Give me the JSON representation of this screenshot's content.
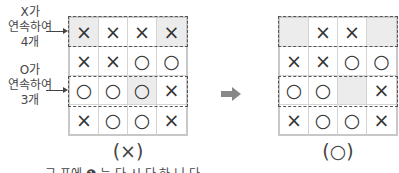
{
  "left_panel": {
    "labels": [
      {
        "lines": [
          "X가",
          "연속하여",
          "4개"
        ]
      },
      {
        "lines": [
          "O가",
          "연속하여",
          "3개"
        ]
      }
    ],
    "grid": [
      [
        "×",
        "×",
        "×",
        "×"
      ],
      [
        "×",
        "×",
        "○",
        "○"
      ],
      [
        "○",
        "○",
        "○",
        "×"
      ],
      [
        "×",
        "○",
        "○",
        "×"
      ]
    ],
    "shaded": [
      [
        0,
        0
      ],
      [
        0,
        3
      ],
      [
        2,
        2
      ]
    ],
    "caption": "(×)"
  },
  "right_panel": {
    "grid": [
      [
        "",
        "×",
        "×",
        ""
      ],
      [
        "×",
        "×",
        "○",
        "○"
      ],
      [
        "○",
        "○",
        "",
        "×"
      ],
      [
        "×",
        "○",
        "○",
        "×"
      ]
    ],
    "shaded": [
      [
        0,
        0
      ],
      [
        0,
        3
      ],
      [
        2,
        2
      ]
    ],
    "caption": "(○)"
  },
  "transition_arrow": "right-arrow-icon",
  "colors": {
    "shade": "#ececec",
    "arrow": "#888888"
  },
  "bottom_partial_text": "그 표에 ❶ 는 다 시 다 하 니 다"
}
